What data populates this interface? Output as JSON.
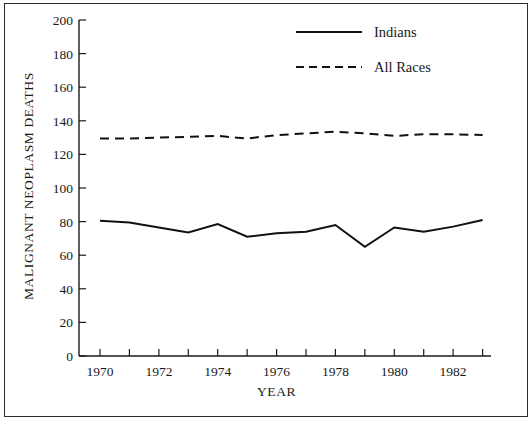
{
  "chart_data": {
    "type": "line",
    "title": "",
    "xlabel": "YEAR",
    "ylabel": "MALIGNANT NEOPLASM DEATHS",
    "xlim": [
      1969,
      1983
    ],
    "ylim": [
      0,
      200
    ],
    "grid": false,
    "legend_position": "top-right",
    "x": [
      1970,
      1971,
      1972,
      1973,
      1974,
      1975,
      1976,
      1977,
      1978,
      1979,
      1980,
      1981,
      1982,
      1983
    ],
    "xticks_major": [
      1970,
      1972,
      1974,
      1976,
      1978,
      1980,
      1982
    ],
    "xticklabels": [
      "1970",
      "1972",
      "1974",
      "1976",
      "1978",
      "1980",
      "1982"
    ],
    "yticks": [
      0,
      20,
      40,
      60,
      80,
      100,
      120,
      140,
      160,
      180,
      200
    ],
    "yticklabels": [
      "0",
      "20",
      "40",
      "60",
      "80",
      "100",
      "120",
      "140",
      "160",
      "180",
      "200"
    ],
    "series": [
      {
        "name": "Indians",
        "style": "solid",
        "color": "#111111",
        "values": [
          80.5,
          79.5,
          76.5,
          73.5,
          78.5,
          71.0,
          73.0,
          74.0,
          78.0,
          65.0,
          76.5,
          74.0,
          77.0,
          81.0
        ]
      },
      {
        "name": "All Races",
        "style": "dashed",
        "color": "#111111",
        "values": [
          129.5,
          129.5,
          130.0,
          130.5,
          131.0,
          129.5,
          131.5,
          132.5,
          133.5,
          132.5,
          131.0,
          132.0,
          132.0,
          131.5
        ]
      }
    ]
  },
  "axes": {
    "y_axis_title": "MALIGNANT NEOPLASM DEATHS",
    "x_axis_title": "YEAR"
  },
  "legend": {
    "entries": [
      {
        "label": "Indians",
        "style": "solid"
      },
      {
        "label": "All Races",
        "style": "dashed"
      }
    ]
  },
  "ytick_labels": {
    "t0": "0",
    "t1": "20",
    "t2": "40",
    "t3": "60",
    "t4": "80",
    "t5": "100",
    "t6": "120",
    "t7": "140",
    "t8": "160",
    "t9": "180",
    "t10": "200"
  },
  "xtick_labels": {
    "t0": "1970",
    "t1": "1972",
    "t2": "1974",
    "t3": "1976",
    "t4": "1978",
    "t5": "1980",
    "t6": "1982"
  },
  "colors": {
    "ink": "#111111",
    "border": "#2b2b2b",
    "background": "#ffffff"
  }
}
